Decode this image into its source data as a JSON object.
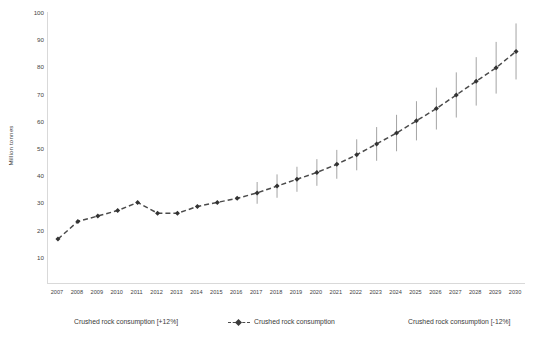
{
  "chart_data": {
    "type": "line",
    "title": "",
    "xlabel": "",
    "ylabel": "Million tonnes",
    "ylim": [
      0,
      100
    ],
    "ytick_step": 10,
    "yticks": [
      10,
      20,
      30,
      40,
      50,
      60,
      70,
      80,
      90,
      100
    ],
    "grid": false,
    "legend_position": "bottom",
    "error_band_pct": 12,
    "error_bars_start_year": 2017,
    "categories": [
      "2007",
      "2008",
      "2009",
      "2010",
      "2011",
      "2012",
      "2013",
      "2014",
      "2015",
      "2016",
      "2017",
      "2018",
      "2019",
      "2020",
      "2021",
      "2022",
      "2023",
      "2024",
      "2025",
      "2026",
      "2027",
      "2028",
      "2029",
      "2030"
    ],
    "series": [
      {
        "name": "Crushed rock consumption",
        "values": [
          16.5,
          23.0,
          25.0,
          27.0,
          30.0,
          26.0,
          26.0,
          28.5,
          30.0,
          31.5,
          33.5,
          36.0,
          38.5,
          41.0,
          44.0,
          47.5,
          51.5,
          55.5,
          60.0,
          64.5,
          69.5,
          74.5,
          79.5,
          85.5
        ]
      },
      {
        "name": "Crushed rock consumption [+12%]",
        "values": [
          null,
          null,
          null,
          null,
          null,
          null,
          null,
          null,
          null,
          null,
          37.5,
          40.3,
          43.1,
          45.9,
          49.3,
          53.2,
          57.7,
          62.2,
          67.2,
          72.2,
          77.8,
          83.4,
          89.0,
          95.8
        ]
      },
      {
        "name": "Crushed rock consumption [-12%]",
        "values": [
          null,
          null,
          null,
          null,
          null,
          null,
          null,
          null,
          null,
          null,
          29.5,
          31.7,
          33.9,
          36.1,
          38.7,
          41.8,
          45.3,
          48.8,
          52.8,
          56.8,
          61.2,
          65.6,
          70.0,
          75.2
        ]
      }
    ],
    "legend": [
      {
        "label": "Crushed rock consumption [+12%]",
        "marker": "none"
      },
      {
        "label": "Crushed rock consumption",
        "marker": "dashed-line-diamond"
      },
      {
        "label": "Crushed rock consumption [-12%]",
        "marker": "none"
      }
    ],
    "colors": {
      "line": "#4b4b4b",
      "marker": "#333333",
      "errorbar": "#9a9a9a",
      "axis": "#d9d9d9",
      "text": "#3f3f3f"
    }
  }
}
